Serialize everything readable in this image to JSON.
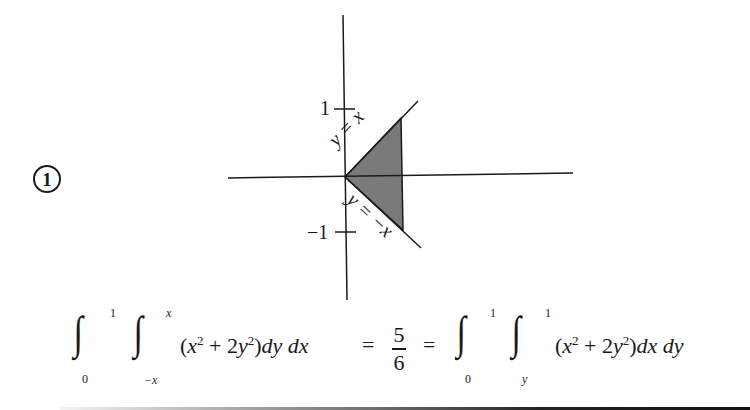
{
  "problem_number": "1",
  "figure": {
    "y_tick_labels": [
      "1",
      "−1"
    ],
    "line_labels": {
      "upper": "y = x",
      "lower": "y = −x"
    },
    "region_fill": "#7a7a7a",
    "axis_color": "#1a1a1a"
  },
  "equation": {
    "lhs": {
      "outer_lower": "0",
      "outer_upper": "1",
      "inner_lower": "−x",
      "inner_upper": "x",
      "integrand": "(x² + 2y²)",
      "differentials": "dy dx"
    },
    "equals": "=",
    "result_numerator": "5",
    "result_denominator": "6",
    "rhs": {
      "outer_lower": "0",
      "outer_upper": "1",
      "inner_lower": "y",
      "inner_upper": "1",
      "integrand": "(x² + 2y²)",
      "differentials": "dx dy"
    }
  }
}
